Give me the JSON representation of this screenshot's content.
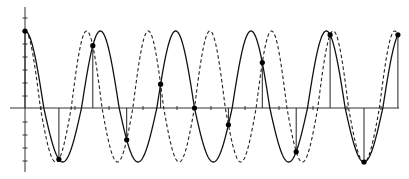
{
  "chart_data": {
    "type": "line",
    "title": "",
    "xlabel": "",
    "ylabel": "",
    "grid": false,
    "legend": null,
    "series": [
      {
        "name": "solid-wave",
        "style": "solid",
        "function": "cos(2*pi*0.45*t)",
        "frequency_relative_to_sampling": 0.45
      },
      {
        "name": "dashed-wave",
        "style": "dashed",
        "function": "cos(2*pi*0.55*t)",
        "frequency_relative_to_sampling": 0.55
      }
    ],
    "samples": {
      "t": [
        0,
        1,
        2,
        3,
        4,
        5,
        6,
        7,
        8,
        9,
        10,
        11
      ],
      "values": [
        1.0,
        -0.95,
        0.81,
        -0.59,
        0.31,
        0.0,
        -0.31,
        0.59,
        -0.81,
        0.95,
        -1.0,
        0.95
      ]
    },
    "xlim": [
      -0.45,
      11.1
    ],
    "ylim": [
      -1.2,
      1.3
    ],
    "x_ticks_count": 11,
    "y_ticks_count": 11
  },
  "layout": {
    "origin_x": 25,
    "axis_y": 108,
    "sample_dx": 33.9,
    "amp_up": 77,
    "amp_down": 54,
    "x_axis_start": 10,
    "x_axis_end": 399,
    "y_axis_top": 7,
    "y_axis_bottom": 172,
    "x_tick_start": 41,
    "x_tick_step": 34,
    "y_tick_values": [
      18,
      31,
      44,
      57,
      70,
      83,
      96,
      122,
      135,
      148,
      161
    ]
  }
}
